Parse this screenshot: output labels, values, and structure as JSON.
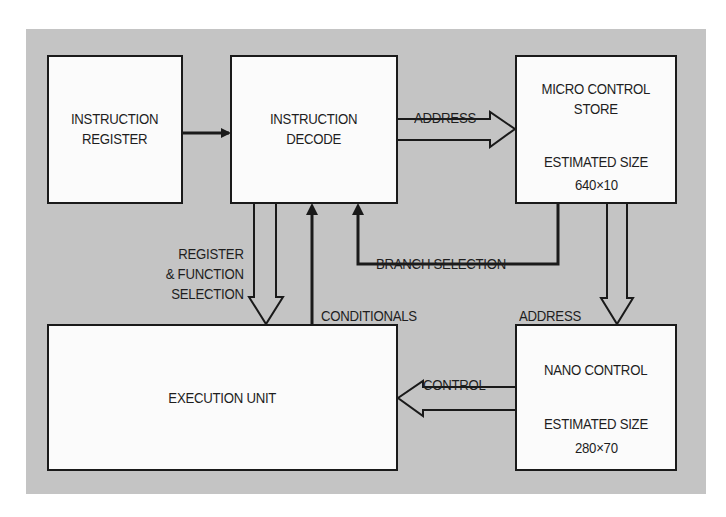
{
  "diagram": {
    "colors": {
      "background_panel": "#c4c4c4",
      "box_fill": "#fbfbfb",
      "line": "#1a1a1a"
    },
    "blocks": {
      "instruction_register": {
        "label": "INSTRUCTION\nREGISTER"
      },
      "instruction_decode": {
        "label": "INSTRUCTION\nDECODE"
      },
      "micro_control_store": {
        "label": "MICRO CONTROL\nSTORE",
        "size_label": "ESTIMATED SIZE",
        "size_value": "640×10"
      },
      "execution_unit": {
        "label": "EXECUTION UNIT"
      },
      "nano_control": {
        "label": "NANO CONTROL",
        "size_label": "ESTIMATED SIZE",
        "size_value": "280×70"
      }
    },
    "connections": [
      {
        "from": "instruction_register",
        "to": "instruction_decode",
        "type": "single-arrow",
        "label": ""
      },
      {
        "from": "instruction_decode",
        "to": "micro_control_store",
        "type": "bus-arrow",
        "label": "ADDRESS"
      },
      {
        "from": "micro_control_store",
        "to": "instruction_decode",
        "type": "single-arrow",
        "label": "BRANCH SELECTION"
      },
      {
        "from": "instruction_decode",
        "to": "execution_unit",
        "type": "bus-arrow",
        "label": "REGISTER\n& FUNCTION\nSELECTION"
      },
      {
        "from": "execution_unit",
        "to": "instruction_decode",
        "type": "single-arrow",
        "label": "CONDITIONALS"
      },
      {
        "from": "micro_control_store",
        "to": "nano_control",
        "type": "bus-arrow",
        "label": "ADDRESS"
      },
      {
        "from": "nano_control",
        "to": "execution_unit",
        "type": "bus-arrow",
        "label": "CONTROL"
      }
    ]
  }
}
